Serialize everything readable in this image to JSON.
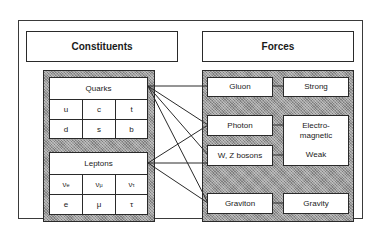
{
  "headers": {
    "constituents": "Constituents",
    "forces": "Forces"
  },
  "quarks": {
    "title": "Quarks",
    "rows": [
      [
        "u",
        "c",
        "t"
      ],
      [
        "d",
        "s",
        "b"
      ]
    ]
  },
  "leptons": {
    "title": "Leptons",
    "rows": [
      [
        "ν",
        "ν",
        "ν"
      ],
      [
        "e",
        "μ",
        "τ"
      ]
    ],
    "subscripts": [
      "e",
      "μ",
      "τ"
    ]
  },
  "bosons": {
    "gluon": "Gluon",
    "photon": "Photon",
    "wz": "W, Z bosons",
    "graviton": "Graviton"
  },
  "forces": {
    "strong": "Strong",
    "electromagnetic": "Electro-\nmagnetic",
    "weak": "Weak",
    "gravity": "Gravity"
  },
  "connections": [
    {
      "from": "Quarks",
      "to": [
        "Gluon",
        "Photon",
        "W, Z bosons",
        "Graviton"
      ]
    },
    {
      "from": "Leptons",
      "to": [
        "Photon",
        "W, Z bosons",
        "Graviton"
      ]
    },
    {
      "from": "Gluon",
      "to": [
        "Strong"
      ]
    },
    {
      "from": "Photon",
      "to": [
        "Electromagnetic"
      ]
    },
    {
      "from": "W, Z bosons",
      "to": [
        "Weak"
      ]
    },
    {
      "from": "Graviton",
      "to": [
        "Gravity"
      ]
    }
  ]
}
